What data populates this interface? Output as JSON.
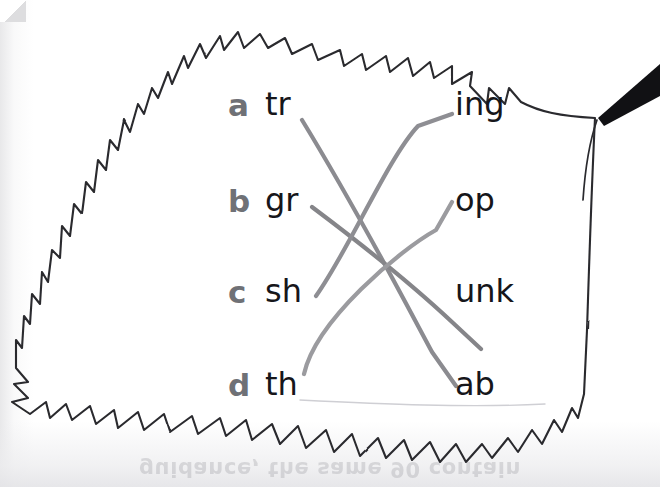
{
  "worksheet": {
    "title": "Word-part matching exercise on a leaf outline",
    "ghost_text": "guidance, the same 90 contain",
    "rows": [
      {
        "key": "a",
        "left": "tr",
        "right": "ing"
      },
      {
        "key": "b",
        "left": "gr",
        "right": "op"
      },
      {
        "key": "c",
        "left": "sh",
        "right": "unk"
      },
      {
        "key": "d",
        "left": "th",
        "right": "ab"
      }
    ],
    "matches": [
      {
        "from": "tr",
        "to": "ab",
        "color": "#8b8b90"
      },
      {
        "from": "gr",
        "to": "unk",
        "color": "#858589"
      },
      {
        "from": "sh",
        "to": "ing",
        "color": "#8e8e93"
      },
      {
        "from": "th",
        "to": "op",
        "color": "#9b9b9f"
      }
    ],
    "colors": {
      "key_letter": "#6f7176",
      "word_text": "#16161a",
      "leaf_outline": "#2a2a2e",
      "stem": "#111114",
      "paper": "#ffffff"
    },
    "shapes": {
      "leaf_outline_path": "M 595,118 C 560,116 540,112 521,102 L 509,88 L 505,104 L 489,88 L 487,104 L 470,86 L 472,72 L 452,84 L 452,66 L 434,78 L 430,62 L 413,76 L 408,58 L 390,72 L 386,56 L 366,70 L 362,54 L 344,66 L 340,50 L 318,60 L 312,44 L 292,54 L 285,38 L 268,48 L 260,34 L 244,48 L 238,32 L 224,50 L 220,36 L 206,58 L 200,44 L 188,68 L 184,56 L 172,84 L 168,72 L 158,98 L 152,88 L 144,114 L 138,104 L 130,132 L 124,120 L 118,150 L 110,140 L 106,170 L 98,160 L 94,192 L 86,182 L 82,214 L 74,204 L 70,236 L 62,226 L 60,258 L 52,250 L 48,282 L 42,272 L 40,304 L 32,294 L 30,324 L 24,316 L 22,348 L 16,340 L 16,368 L 28,382 L 14,384 L 28,398 L 12,402 L 30,414 L 46,402 L 50,418 L 66,404 L 72,420 L 90,406 L 96,424 L 114,410 L 118,428 L 138,412 L 144,430 L 164,414 L 170,432 L 192,416 L 198,434 L 220,418 L 226,436 L 246,420 L 252,440 L 272,424 L 280,444 L 298,426 L 306,448 L 326,430 L 334,452 L 352,434 L 360,456 L 378,438 L 386,458 L 404,440 L 412,460 L 430,442 L 440,462 L 456,444 L 466,462 L 482,444 L 492,458 L 508,438 L 518,452 L 532,430 L 542,444 L 554,420 L 562,432 L 572,408 L 578,418 L 584,394 L 587,330 C 589,270 591,200 595,118 Z",
      "stem_path": "M 598,118 L 660,64 L 660,96 L 604,126 Z",
      "leaf_tip_vein": "M 597,120 C 590,140 585,170 583,200"
    }
  }
}
